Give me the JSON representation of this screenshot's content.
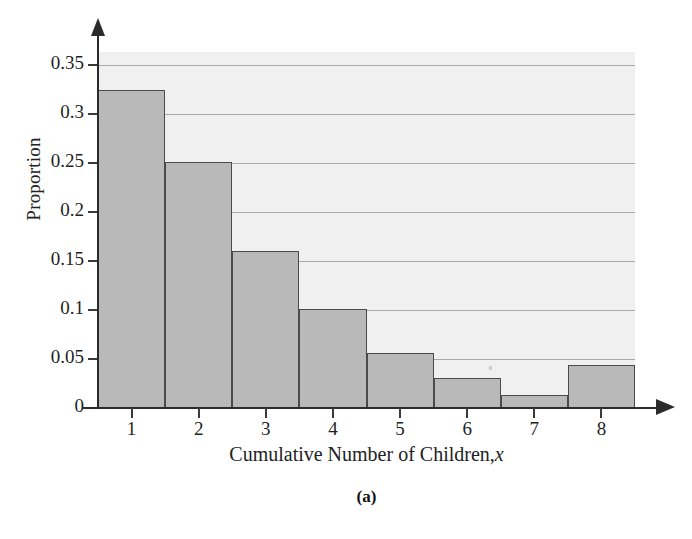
{
  "chart_data": {
    "type": "bar",
    "title": "",
    "subtitle": "",
    "xlabel": "Cumulative Number of Children, x",
    "xlabel_plain": "Cumulative Number of Children,",
    "xlabel_italic_var": "x",
    "ylabel": "Proportion",
    "categories": [
      "1",
      "2",
      "3",
      "4",
      "5",
      "6",
      "7",
      "8"
    ],
    "values": [
      0.325,
      0.251,
      0.16,
      0.101,
      0.056,
      0.031,
      0.013,
      0.044
    ],
    "x": [
      1,
      2,
      3,
      4,
      5,
      6,
      7,
      8
    ],
    "xlim": [
      0.5,
      8.5
    ],
    "ylim": [
      0,
      0.365
    ],
    "ytick_labels": [
      "0",
      "0.05",
      "0.1",
      "0.15",
      "0.2",
      "0.25",
      "0.3",
      "0.35"
    ],
    "ytick_values": [
      0,
      0.05,
      0.1,
      0.15,
      0.2,
      0.25,
      0.3,
      0.35
    ],
    "xtick_labels": [
      "1",
      "2",
      "3",
      "4",
      "5",
      "6",
      "7",
      "8"
    ],
    "grid": true,
    "grid_axis": "y",
    "legend": false,
    "legend_position": "none",
    "bar_fill_color": "#b9b9b9",
    "bar_edge_color": "#4a4a4a",
    "plot_background_color": "#f0f0f0",
    "gridline_color": "#a9a9a9",
    "axis_color": "#2b2b2b"
  },
  "caption": "(a)"
}
